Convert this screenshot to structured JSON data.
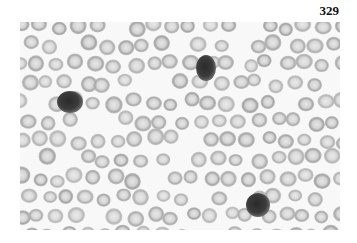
{
  "page": {
    "number": "329"
  },
  "figure": {
    "colors": {
      "background": "#f8f8f8",
      "rbc_ring": "#9a9a9a",
      "rbc_center": "#e2e2e2",
      "leukocyte": "#3a3a3a"
    },
    "leukocytes": [
      {
        "cx": 50,
        "cy": 80,
        "rx": 13,
        "ry": 11
      },
      {
        "cx": 186,
        "cy": 46,
        "rx": 10,
        "ry": 13
      },
      {
        "cx": 238,
        "cy": 183,
        "rx": 12,
        "ry": 12
      }
    ]
  }
}
